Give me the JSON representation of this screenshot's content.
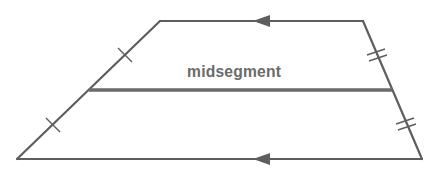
{
  "diagram": {
    "type": "trapezoid-midsegment",
    "label": "midsegment",
    "colors": {
      "stroke": "#5e5e5e",
      "midsegment": "#6a6a6a",
      "text": "#6b6b6b",
      "background": "#ffffff"
    },
    "vertices": {
      "top_left": [
        160,
        21
      ],
      "top_right": [
        363,
        21
      ],
      "bottom_right": [
        422,
        159
      ],
      "bottom_left": [
        17,
        159
      ]
    },
    "midsegment": {
      "from": [
        89,
        90
      ],
      "to": [
        392,
        90
      ]
    },
    "parallel_marks": {
      "count": 2,
      "direction": "left"
    },
    "congruence_marks": {
      "left_leg": "single tick (2 marks)",
      "right_leg": "double tick (2 marks)"
    }
  }
}
